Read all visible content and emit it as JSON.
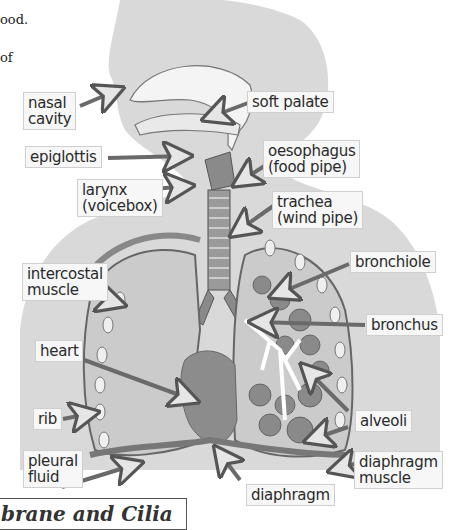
{
  "page_text": {
    "line1": "ood.",
    "line2": "of"
  },
  "diagram": {
    "labels": {
      "nasal_cavity": [
        "nasal",
        "cavity"
      ],
      "soft_palate": [
        "soft palate"
      ],
      "epiglottis": [
        "epiglottis"
      ],
      "oesophagus": [
        "oesophagus",
        "(food pipe)"
      ],
      "larynx": [
        "larynx",
        "(voicebox)"
      ],
      "trachea": [
        "trachea",
        "(wind pipe)"
      ],
      "intercostal_muscle": [
        "intercostal",
        "muscle"
      ],
      "bronchiole": [
        "bronchiole"
      ],
      "bronchus": [
        "bronchus"
      ],
      "heart": [
        "heart"
      ],
      "rib": [
        "rib"
      ],
      "alveoli": [
        "alveoli"
      ],
      "pleural_fluid": [
        "pleural",
        "fluid"
      ],
      "diaphragm_muscle": [
        "diaphragm",
        "muscle"
      ],
      "diaphragm": [
        "diaphragm"
      ]
    },
    "colors": {
      "body_silhouette": "#d9d9d9",
      "lung_fill": "#c8c8c8",
      "lung_outline": "#6e6e6e",
      "heart": "#8c8c8c",
      "alveoli": "#8a8a8a",
      "bronchi": "#ffffff",
      "arrow": "#6a6a6a",
      "label_bg": "#f7f7f7"
    }
  },
  "caption": {
    "text": "brane and Cilia"
  }
}
